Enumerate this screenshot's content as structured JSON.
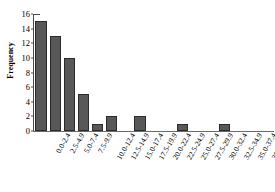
{
  "chart_data": {
    "type": "bar",
    "title": "",
    "xlabel": "",
    "ylabel": "Frequency",
    "ylim": [
      0,
      16
    ],
    "ytick_step": 2,
    "yticks": [
      0,
      2,
      4,
      6,
      8,
      10,
      12,
      14,
      16
    ],
    "grid": false,
    "legend": "none",
    "categories": [
      "0.0-2.4",
      "2.5-4.9",
      "5.0-7.4",
      "7.5-9.9",
      "10.0-12.4",
      "12.5-14.9",
      "15.0-17.4",
      "17.5-19.9",
      "20.0-22.4",
      "22.5-24.9",
      "25.0-27.4",
      "27.5-29.9",
      "30.0-32.4",
      "32.5-34.9",
      "35.0-37.4",
      "37.5-39.9",
      "More"
    ],
    "values": [
      15,
      13,
      10,
      5,
      1,
      2,
      0,
      2,
      0,
      0,
      1,
      0,
      0,
      1,
      0,
      0,
      0
    ],
    "bar_color": "#585858",
    "bar_edge_color": "#2b2b2b",
    "axis_color": "#4a4a4a",
    "background_color": "#ffffff"
  }
}
